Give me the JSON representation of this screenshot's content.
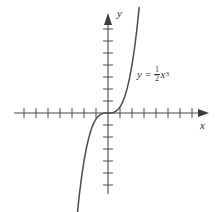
{
  "figure": {
    "kind": "cartesian-graph",
    "background_color": "#ffffff",
    "axis_color": "#4a4a4a",
    "curve_color": "#4c4c4c",
    "text_color": "#2b2b2b"
  },
  "labels": {
    "x_axis": "x",
    "y_axis": "y",
    "equation_lhs": "y",
    "equation_equals": "=",
    "equation_numerator": "1",
    "equation_denominator": "2",
    "equation_variable": "x",
    "equation_exponent": "3",
    "equation_full": "y = 1/2 x^3"
  },
  "chart_data": {
    "type": "line",
    "title": "",
    "xlabel": "x",
    "ylabel": "y",
    "legend": [
      "y = 1/2 x^3"
    ],
    "grid": false,
    "xlim": [
      -8,
      8
    ],
    "ylim": [
      -8,
      8
    ],
    "x_ticks": [
      -8,
      -7,
      -6,
      -5,
      -4,
      -3,
      -2,
      -1,
      1,
      2,
      3,
      4,
      5,
      6,
      7,
      8
    ],
    "y_ticks": [
      -8,
      -7,
      -6,
      -5,
      -4,
      -3,
      -2,
      -1,
      1,
      2,
      3,
      4,
      5,
      6,
      7,
      8
    ],
    "tick_labels_shown": false,
    "axis_arrows": [
      "x-positive",
      "y-positive"
    ],
    "series": [
      {
        "name": "y = 1/2 x^3",
        "equation": "y = 0.5 * x^3",
        "x": [
          -2.6,
          -2.4,
          -2.2,
          -2.0,
          -1.8,
          -1.6,
          -1.4,
          -1.2,
          -1.0,
          -0.8,
          -0.6,
          -0.4,
          -0.2,
          0.0,
          0.2,
          0.4,
          0.6,
          0.8,
          1.0,
          1.2,
          1.4,
          1.6,
          1.8,
          2.0,
          2.2,
          2.4,
          2.6
        ],
        "y": [
          -8.79,
          -6.91,
          -5.32,
          -4.0,
          -2.92,
          -2.05,
          -1.37,
          -0.86,
          -0.5,
          -0.26,
          -0.11,
          -0.03,
          -0.004,
          0.0,
          0.004,
          0.03,
          0.11,
          0.26,
          0.5,
          0.86,
          1.37,
          2.05,
          2.92,
          4.0,
          5.32,
          6.91,
          8.79
        ]
      }
    ]
  }
}
